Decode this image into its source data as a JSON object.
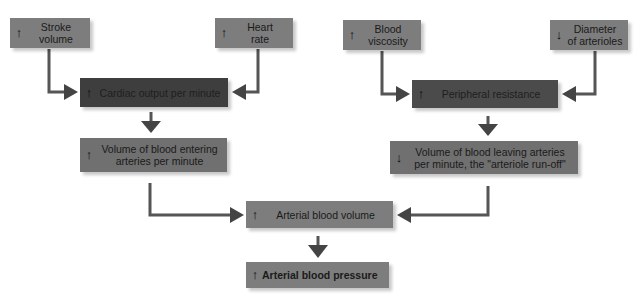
{
  "diagram": {
    "title": "",
    "nodes": [
      {
        "id": "stroke_volume",
        "direction": "up",
        "arrow": "↑",
        "label": "Stroke volume",
        "lines": [
          "Stroke",
          "volume"
        ]
      },
      {
        "id": "heart_rate",
        "direction": "up",
        "arrow": "↑",
        "label": "Heart rate",
        "lines": [
          "Heart",
          "rate"
        ]
      },
      {
        "id": "cardiac_output",
        "direction": "up",
        "arrow": "↑",
        "label": "Cardiac output per minute"
      },
      {
        "id": "volume_entering",
        "direction": "up",
        "arrow": "↑",
        "label": "Volume of blood entering arteries per minute",
        "lines": [
          "Volume of blood entering",
          "arteries per minute"
        ]
      },
      {
        "id": "blood_viscosity",
        "direction": "up",
        "arrow": "↑",
        "label": "Blood viscosity",
        "lines": [
          "Blood",
          "viscosity"
        ]
      },
      {
        "id": "diameter_arterioles",
        "direction": "down",
        "arrow": "↓",
        "label": "Diameter of arterioles",
        "lines": [
          "Diameter",
          "of arterioles"
        ]
      },
      {
        "id": "peripheral_resistance",
        "direction": "up",
        "arrow": "↑",
        "label": "Peripheral resistance"
      },
      {
        "id": "volume_leaving",
        "direction": "down",
        "arrow": "↓",
        "label": "Volume of blood leaving arteries per minute, the \"arteriole run-off\"",
        "lines": [
          "Volume of blood leaving arteries",
          "per minute, the \"arteriole run-off\""
        ]
      },
      {
        "id": "arterial_blood_volume",
        "direction": "up",
        "arrow": "↑",
        "label": "Arterial blood volume"
      },
      {
        "id": "arterial_blood_pressure",
        "direction": "up",
        "arrow": "↑",
        "label": "Arterial blood pressure"
      }
    ],
    "edges": [
      {
        "from": "stroke_volume",
        "to": "cardiac_output"
      },
      {
        "from": "heart_rate",
        "to": "cardiac_output"
      },
      {
        "from": "cardiac_output",
        "to": "volume_entering"
      },
      {
        "from": "blood_viscosity",
        "to": "peripheral_resistance"
      },
      {
        "from": "diameter_arterioles",
        "to": "peripheral_resistance"
      },
      {
        "from": "peripheral_resistance",
        "to": "volume_leaving"
      },
      {
        "from": "volume_entering",
        "to": "arterial_blood_volume"
      },
      {
        "from": "volume_leaving",
        "to": "arterial_blood_volume"
      },
      {
        "from": "arterial_blood_volume",
        "to": "arterial_blood_pressure"
      }
    ],
    "colors": {
      "box_light": "#7d7d7d",
      "box_dark": "#3e3e3e",
      "connector": "#555555",
      "background": "#ffffff"
    }
  }
}
